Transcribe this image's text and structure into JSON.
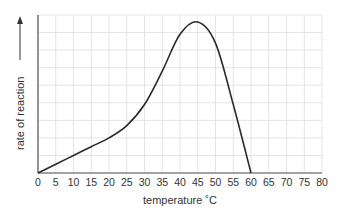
{
  "chart_data": {
    "type": "line",
    "title": "",
    "xlabel": "temperature ˚C",
    "ylabel": "rate of reaction",
    "xlim": [
      0,
      80
    ],
    "ylim": [
      0,
      9
    ],
    "grid": true,
    "x_ticks": [
      0,
      5,
      10,
      15,
      20,
      25,
      30,
      35,
      40,
      45,
      50,
      55,
      60,
      65,
      70,
      75,
      80
    ],
    "y_ticks": [],
    "series": [
      {
        "name": "rate of reaction",
        "x": [
          0,
          5,
          10,
          15,
          20,
          25,
          30,
          35,
          40,
          45,
          50,
          55,
          60
        ],
        "values": [
          0,
          0.5,
          1.0,
          1.5,
          2.0,
          2.7,
          3.9,
          5.8,
          7.9,
          8.6,
          7.4,
          3.9,
          0
        ]
      }
    ],
    "annotations": [
      "y-axis label with upward arrow"
    ]
  }
}
